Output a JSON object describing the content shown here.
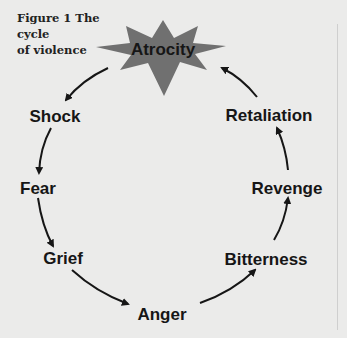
{
  "figure": {
    "title": "Figure 1 The cycle of violence",
    "title_line1": "Figure 1 The cycle",
    "title_line2": "of violence"
  },
  "colors": {
    "background": "#ebebea",
    "star_fill": "#707070",
    "text": "#161616",
    "arrow": "#161616"
  },
  "cycle": {
    "center": "Atrocity",
    "nodes": [
      {
        "label": "Atrocity"
      },
      {
        "label": "Shock"
      },
      {
        "label": "Fear"
      },
      {
        "label": "Grief"
      },
      {
        "label": "Anger"
      },
      {
        "label": "Bitterness"
      },
      {
        "label": "Revenge"
      },
      {
        "label": "Retaliation"
      }
    ],
    "edges": [
      {
        "from": "Atrocity",
        "to": "Shock"
      },
      {
        "from": "Shock",
        "to": "Fear"
      },
      {
        "from": "Fear",
        "to": "Grief"
      },
      {
        "from": "Grief",
        "to": "Anger"
      },
      {
        "from": "Anger",
        "to": "Bitterness"
      },
      {
        "from": "Bitterness",
        "to": "Revenge"
      },
      {
        "from": "Revenge",
        "to": "Retaliation"
      },
      {
        "from": "Retaliation",
        "to": "Atrocity"
      }
    ]
  }
}
